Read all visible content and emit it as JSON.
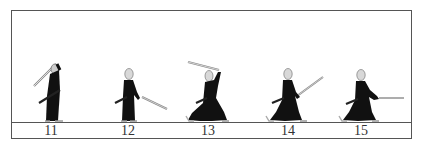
{
  "figure": {
    "frames": [
      {
        "number": "11",
        "pose": "sword-raised-overhead-back",
        "x": 51
      },
      {
        "number": "12",
        "pose": "sword-low-right-diagonal",
        "x": 128
      },
      {
        "number": "13",
        "pose": "sword-overhead-striding",
        "x": 208
      },
      {
        "number": "14",
        "pose": "sword-raised-diagonal-lunge",
        "x": 288
      },
      {
        "number": "15",
        "pose": "sword-horizontal-thrust-lunge",
        "x": 361
      }
    ]
  },
  "colors": {
    "frame": "#555555",
    "robe": "#111111",
    "head": "#d8d8d8",
    "blade": "#bbbbbb"
  }
}
